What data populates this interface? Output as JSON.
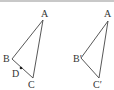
{
  "figure": {
    "colors": {
      "stroke": "#444444",
      "text": "#333333",
      "border": "#c8c8c8"
    },
    "left_triangle": {
      "vertices": {
        "A": {
          "label": "A",
          "x": 43,
          "y": 20,
          "lx": 41,
          "ly": 17
        },
        "B": {
          "label": "B",
          "x": 12,
          "y": 59,
          "lx": 3,
          "ly": 62
        },
        "C": {
          "label": "C",
          "x": 33,
          "y": 78,
          "lx": 28,
          "ly": 88
        }
      },
      "point_D": {
        "label": "D",
        "x": 21,
        "y": 68,
        "lx": 12,
        "ly": 77
      }
    },
    "right_triangle": {
      "vertices": {
        "A": {
          "label": "A",
          "x": 108,
          "y": 21,
          "lx": 104,
          "ly": 17
        },
        "B": {
          "label": "B′",
          "x": 81,
          "y": 58,
          "lx": 73,
          "ly": 62
        },
        "C": {
          "label": "C′",
          "x": 99,
          "y": 78,
          "lx": 93,
          "ly": 88
        }
      }
    }
  }
}
